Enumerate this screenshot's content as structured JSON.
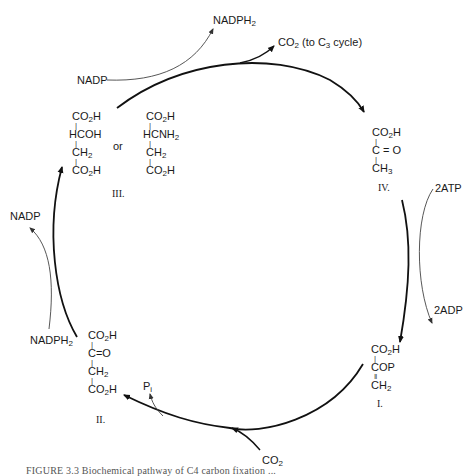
{
  "diagram": {
    "type": "metabolic-cycle",
    "cycle_direction": "clockwise",
    "compounds": [
      {
        "id": "I",
        "label": "I.",
        "lines": [
          "CO2H",
          "COP",
          "CH2"
        ],
        "bonds": [
          "single",
          "double"
        ],
        "name_hint": "phosphoenolpyruvate"
      },
      {
        "id": "II",
        "label": "II.",
        "lines": [
          "CO2H",
          "C=O",
          "CH2",
          "CO2H"
        ],
        "bonds": [
          "single",
          "single",
          "single"
        ],
        "name_hint": "oxaloacetate"
      },
      {
        "id": "III",
        "label": "III.",
        "alt_a": [
          "CO2H",
          "HCOH",
          "CH2",
          "CO2H"
        ],
        "connector": "or",
        "alt_b": [
          "CO2H",
          "HCNH2",
          "CH2",
          "CO2H"
        ],
        "name_hint": "malate or aspartate"
      },
      {
        "id": "IV",
        "label": "IV.",
        "lines": [
          "CO2H",
          "C=O",
          "CH3"
        ],
        "bonds": [
          "single",
          "single"
        ],
        "name_hint": "pyruvate"
      }
    ],
    "side_reactions": [
      {
        "step": "I to II",
        "in": "CO2",
        "out": "Pi"
      },
      {
        "step": "II to III",
        "in": "NADPH2",
        "out": "NADP"
      },
      {
        "step": "III to IV",
        "in": "NADP",
        "out": "NADPH2",
        "released": "CO2 (to C3 cycle)"
      },
      {
        "step": "IV to I",
        "in": "2ATP",
        "out": "2ADP"
      }
    ],
    "labels": {
      "nadph2_top": "NADPH",
      "nadp_top": "NADP",
      "co2_out_a": "CO",
      "co2_out_b": " (to C",
      "co2_out_c": " cycle)",
      "atp": "2ATP",
      "adp": "2ADP",
      "nadp_left": "NADP",
      "nadph2_left": "NADPH",
      "pi": "P",
      "pi_sub": "i",
      "co2_bottom": "CO",
      "or": "or",
      "sub2": "2",
      "sub3": "3"
    },
    "compound_text": {
      "co2h": "CO",
      "h": "H",
      "hcoh": "HCOH",
      "hcnh": "HCNH",
      "ch": "CH",
      "co": "C = O",
      "co_tight": "C=O",
      "cop": "COP",
      "single_bond": "|",
      "double_bond": "‖"
    },
    "roman_labels": {
      "I": "I.",
      "II": "II.",
      "III": "III.",
      "IV": "IV."
    },
    "caption": "FIGURE 3.3   Biochemical pathway of C4 carbon fixation ..."
  }
}
